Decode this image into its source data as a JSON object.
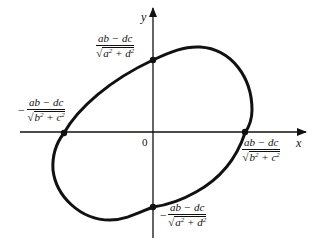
{
  "diagram": {
    "type": "ellipse-on-axes",
    "axes": {
      "x_label": "x",
      "y_label": "y",
      "origin_label": "0"
    },
    "intercepts": {
      "y_positive": {
        "sign": "",
        "numerator": "ab − dc",
        "radicand_a": "a",
        "radicand_b": "d",
        "exp": "2"
      },
      "y_negative": {
        "sign": "−",
        "numerator": "ab − dc",
        "radicand_a": "a",
        "radicand_b": "d",
        "exp": "2"
      },
      "x_positive": {
        "sign": "",
        "numerator": "ab − dc",
        "radicand_a": "b",
        "radicand_b": "c",
        "exp": "2"
      },
      "x_negative": {
        "sign": "−",
        "numerator": "ab − dc",
        "radicand_a": "b",
        "radicand_b": "c",
        "exp": "2"
      }
    },
    "colors": {
      "stroke": "#111111",
      "background": "#ffffff"
    }
  }
}
